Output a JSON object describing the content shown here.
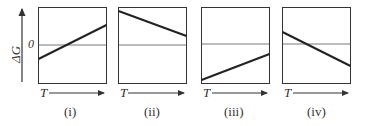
{
  "figure": {
    "y_axis_label": "ΔG",
    "zero_label": "0",
    "x_axis_label": "T",
    "panels": [
      {
        "id": "i",
        "label": "(i)",
        "line": {
          "start": "below zero",
          "end": "above zero",
          "trend": "increasing"
        }
      },
      {
        "id": "ii",
        "label": "(ii)",
        "line": {
          "start": "above zero",
          "end": "above zero",
          "trend": "decreasing"
        }
      },
      {
        "id": "iii",
        "label": "(iii)",
        "line": {
          "start": "below zero",
          "end": "below zero",
          "trend": "increasing"
        }
      },
      {
        "id": "iv",
        "label": "(iv)",
        "line": {
          "start": "above zero",
          "end": "below zero",
          "trend": "decreasing"
        }
      }
    ]
  },
  "colors": {
    "frame": "#333333",
    "zero_line": "#555555",
    "data_line": "#222222"
  }
}
